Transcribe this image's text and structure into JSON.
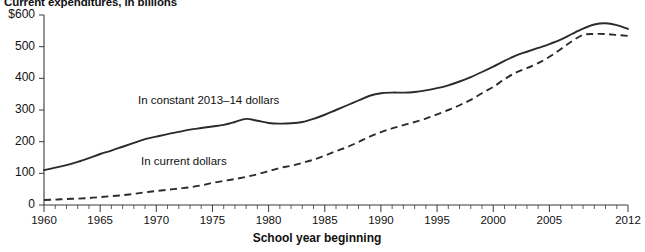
{
  "chart_data": {
    "type": "line",
    "title": "Current expenditures, in billions",
    "xlabel": "School year beginning",
    "ylabel": "",
    "xlim": [
      1960,
      2012
    ],
    "ylim": [
      0,
      600
    ],
    "grid": false,
    "legend_position": "inline-annotations",
    "ytick_labels": [
      "$600",
      "500",
      "400",
      "300",
      "200",
      "100",
      "0"
    ],
    "ytick_values": [
      600,
      500,
      400,
      300,
      200,
      100,
      0
    ],
    "xtick_labels": [
      "1960",
      "1965",
      "1970",
      "1975",
      "1980",
      "1985",
      "1990",
      "1995",
      "2000",
      "2005",
      "2012"
    ],
    "xtick_values": [
      1960,
      1965,
      1970,
      1975,
      1980,
      1985,
      1990,
      1995,
      2000,
      2005,
      2012
    ],
    "x": [
      1960,
      1961,
      1962,
      1963,
      1964,
      1965,
      1966,
      1967,
      1968,
      1969,
      1970,
      1971,
      1972,
      1973,
      1974,
      1975,
      1976,
      1977,
      1978,
      1979,
      1980,
      1981,
      1982,
      1983,
      1984,
      1985,
      1986,
      1987,
      1988,
      1989,
      1990,
      1991,
      1992,
      1993,
      1994,
      1995,
      1996,
      1997,
      1998,
      1999,
      2000,
      2001,
      2002,
      2003,
      2004,
      2005,
      2006,
      2007,
      2008,
      2009,
      2010,
      2011,
      2012
    ],
    "series": [
      {
        "name": "In constant 2013–14 dollars",
        "style": "solid",
        "values": [
          110,
          118,
          126,
          136,
          148,
          161,
          172,
          184,
          196,
          208,
          216,
          224,
          231,
          238,
          243,
          248,
          253,
          262,
          272,
          266,
          259,
          257,
          258,
          262,
          272,
          285,
          300,
          315,
          330,
          345,
          353,
          355,
          355,
          357,
          362,
          369,
          378,
          390,
          404,
          420,
          437,
          455,
          472,
          484,
          496,
          508,
          522,
          540,
          557,
          570,
          574,
          568,
          556
        ]
      },
      {
        "name": "In current dollars",
        "style": "dashed",
        "values": [
          16,
          17,
          19,
          20,
          22,
          25,
          28,
          31,
          35,
          40,
          44,
          48,
          52,
          56,
          62,
          70,
          76,
          82,
          89,
          97,
          107,
          117,
          124,
          133,
          143,
          156,
          170,
          183,
          199,
          216,
          230,
          242,
          252,
          262,
          273,
          286,
          300,
          315,
          332,
          353,
          373,
          397,
          418,
          432,
          448,
          468,
          492,
          517,
          537,
          540,
          540,
          537,
          534
        ]
      }
    ],
    "annotations": [
      {
        "text": "In constant 2013–14 dollars"
      },
      {
        "text": "In current dollars"
      }
    ]
  }
}
